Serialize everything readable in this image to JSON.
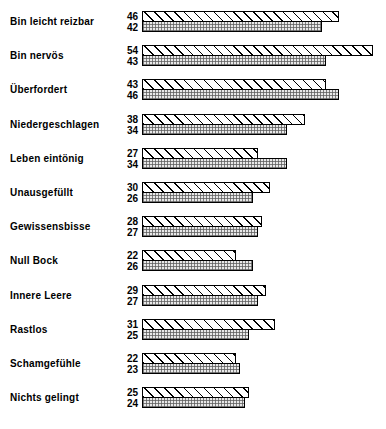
{
  "chart_data": {
    "type": "bar",
    "orientation": "horizontal",
    "title": "",
    "subtitle": "",
    "xlabel": "",
    "ylabel": "",
    "grid": false,
    "legend_position": "none",
    "axis_visible": false,
    "value_labels_position": "left-of-bars",
    "xlim": [
      0,
      54
    ],
    "categories": [
      "Bin leicht reizbar",
      "Bin nervös",
      "Überfordert",
      "Niedergeschlagen",
      "Leben eintönig",
      "Unausgefüllt",
      "Gewissensbisse",
      "Null Bock",
      "Innere Leere",
      "Rastlos",
      "Schamgefühle",
      "Nichts gelingt"
    ],
    "series": [
      {
        "name": "series-1",
        "pattern": "diagonal-hatch",
        "values": [
          46,
          54,
          43,
          38,
          27,
          30,
          28,
          22,
          29,
          31,
          22,
          25
        ]
      },
      {
        "name": "series-2",
        "pattern": "fine-grid",
        "values": [
          42,
          43,
          46,
          34,
          34,
          26,
          27,
          26,
          27,
          25,
          23,
          24
        ]
      }
    ],
    "rows": [
      {
        "label": "Bin leicht reizbar",
        "top": 46,
        "bottom": 42
      },
      {
        "label": "Bin nervös",
        "top": 54,
        "bottom": 43
      },
      {
        "label": "Überfordert",
        "top": 43,
        "bottom": 46
      },
      {
        "label": "Niedergeschlagen",
        "top": 38,
        "bottom": 34
      },
      {
        "label": "Leben eintönig",
        "top": 27,
        "bottom": 34
      },
      {
        "label": "Unausgefüllt",
        "top": 30,
        "bottom": 26
      },
      {
        "label": "Gewissensbisse",
        "top": 28,
        "bottom": 27
      },
      {
        "label": "Null Bock",
        "top": 22,
        "bottom": 26
      },
      {
        "label": "Innere Leere",
        "top": 29,
        "bottom": 27
      },
      {
        "label": "Rastlos",
        "top": 31,
        "bottom": 25
      },
      {
        "label": "Schamgefühle",
        "top": 22,
        "bottom": 23
      },
      {
        "label": "Nichts gelingt",
        "top": 25,
        "bottom": 24
      }
    ],
    "colors": {
      "background": "#ffffff",
      "text": "#000000",
      "bar_outline": "#000000",
      "bar_top_fill": "#ffffff",
      "bar_bottom_fill": "#e8e8e8"
    }
  }
}
